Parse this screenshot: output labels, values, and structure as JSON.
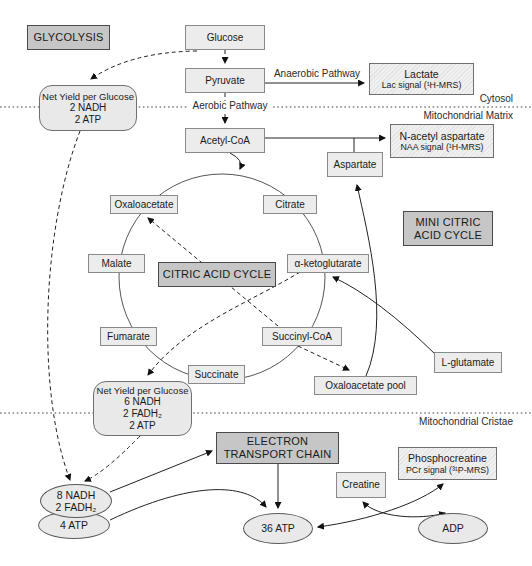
{
  "titles": {
    "glycolysis": "GLYCOLYSIS",
    "citric_acid_cycle": "CITRIC ACID CYCLE",
    "mini_citric_line1": "MINI CITRIC",
    "mini_citric_line2": "ACID CYCLE",
    "etc_line1": "ELECTRON",
    "etc_line2": "TRANSPORT CHAIN"
  },
  "metabolites": {
    "glucose": "Glucose",
    "pyruvate": "Pyruvate",
    "acetyl_coa": "Acetyl-CoA",
    "aspartate": "Aspartate",
    "oxaloacetate": "Oxaloacetate",
    "citrate": "Citrate",
    "malate": "Malate",
    "alpha_ketoglutarate": "α-ketoglutarate",
    "fumarate": "Fumarate",
    "succinyl_coa": "Succinyl-CoA",
    "succinate": "Succinate",
    "l_glutamate": "L-glutamate",
    "oxaloacetate_pool": "Oxaloacetate pool",
    "creatine": "Creatine"
  },
  "signals": {
    "lactate": {
      "name": "Lactate",
      "signal": "Lac signal (¹H-MRS)"
    },
    "naa": {
      "name": "N-acetyl aspartate",
      "signal": "NAA signal (¹H-MRS)"
    },
    "phosphocreatine": {
      "name": "Phosphocreatine",
      "signal": "PCr signal (³¹P-MRS)"
    }
  },
  "yields": {
    "glycolysis": {
      "title": "Net Yield per Glucose",
      "lines": [
        "2 NADH",
        "2 ATP"
      ]
    },
    "cycle": {
      "title": "Net Yield per Glucose",
      "lines": [
        "6 NADH",
        "2 FADH₂",
        "2 ATP"
      ]
    }
  },
  "pools": {
    "nadh_line1": "8 NADH",
    "nadh_line2": "2 FADH₂",
    "atp4": "4 ATP",
    "atp36": "36 ATP",
    "adp": "ADP"
  },
  "pathway_labels": {
    "anaerobic": "Anaerobic Pathway",
    "aerobic": "Aerobic Pathway"
  },
  "regions": {
    "cytosol": "Cytosol",
    "mitochondrial_matrix": "Mitochondrial Matrix",
    "mitochondrial_cristae": "Mitochondrial Cristae"
  },
  "colors": {
    "background": "#ffffff",
    "title_box_fill": "#c6c6c6",
    "node_box_fill": "#ececec",
    "signal_box_fill": "#e8e8e8",
    "line": "#333333"
  }
}
